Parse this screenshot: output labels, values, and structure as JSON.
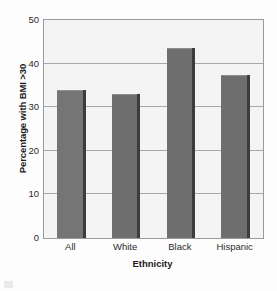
{
  "chart_data": {
    "type": "bar",
    "title": "",
    "subtitle": "",
    "xlabel": "Ethnicity",
    "ylabel": "Percentage with BMI >30",
    "categories": [
      "All",
      "White",
      "Black",
      "Hispanic"
    ],
    "values": [
      34,
      33,
      43.5,
      37.5
    ],
    "ylim": [
      0,
      50
    ],
    "ytick_labels": [
      "0",
      "10",
      "20",
      "30",
      "40",
      "50"
    ],
    "ytick_values": [
      0,
      10,
      20,
      30,
      40,
      50
    ],
    "grid": true,
    "grid_axis": "y",
    "legend": false,
    "legend_position": "none",
    "annotations": [],
    "series": [
      {
        "name": "Percentage with BMI >30",
        "values": [
          34,
          33,
          43.5,
          37.5
        ]
      }
    ],
    "bar_colors": [
      "#757575",
      "#6e6e6e",
      "#6e6e6e",
      "#6e6e6e"
    ],
    "plot_background": "#f4f4f4",
    "plot_border_color": "#9a9a9a",
    "gridline_color": "#a8a8a8",
    "bar_shadow_color": "#3c3c3c"
  },
  "axis": {
    "y_title": "Percentage with BMI >30",
    "x_title": "Ethnicity",
    "y_ticks": [
      {
        "label": "50",
        "value": 50
      },
      {
        "label": "40",
        "value": 40
      },
      {
        "label": "30",
        "value": 30
      },
      {
        "label": "20",
        "value": 20
      },
      {
        "label": "10",
        "value": 10
      },
      {
        "label": "0",
        "value": 0
      }
    ],
    "x_ticks": [
      {
        "label": "All"
      },
      {
        "label": "White"
      },
      {
        "label": "Black"
      },
      {
        "label": "Hispanic"
      }
    ]
  }
}
